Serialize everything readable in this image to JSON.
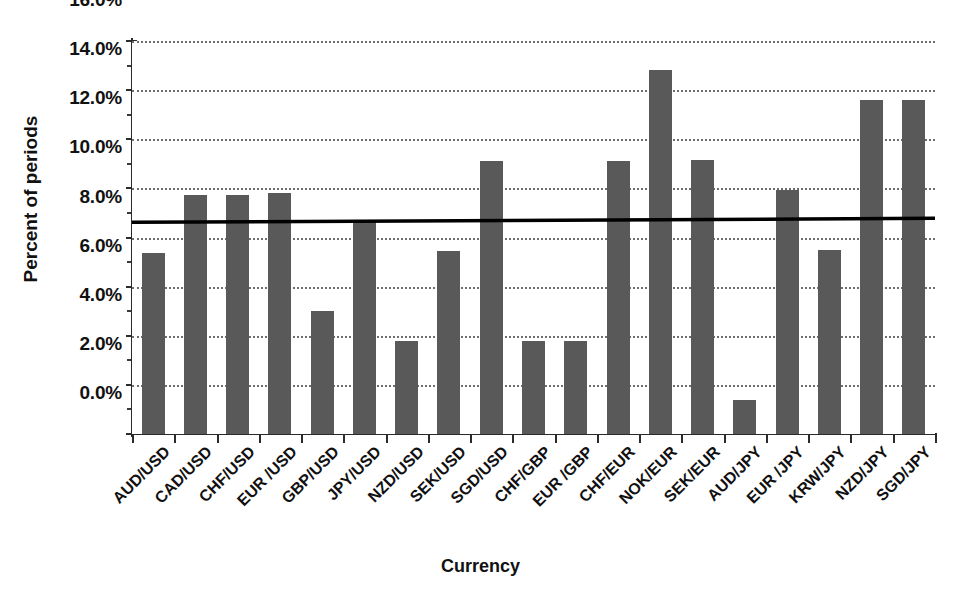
{
  "chart_data": {
    "type": "bar",
    "title": "",
    "xlabel": "Currency",
    "ylabel": "Percent of periods",
    "ylim": [
      0,
      16
    ],
    "ytick_labels": [
      "0.0%",
      "2.0%",
      "4.0%",
      "6.0%",
      "8.0%",
      "10.0%",
      "12.0%",
      "14.0%",
      "16.0%"
    ],
    "ytick_values": [
      0,
      2,
      4,
      6,
      8,
      10,
      12,
      14,
      16
    ],
    "grid": "horizontal-dotted",
    "legend": "none",
    "bar_color": "#595959",
    "axis_color": "#2b2b2b",
    "gridline_color": "#6e6e6e",
    "trendline_color": "#000000",
    "categories": [
      "AUD/USD",
      "CAD/USD",
      "CHF/USD",
      "EUR /USD",
      "GBP/USD",
      "JPY/USD",
      "NZD/USD",
      "SEK/USD",
      "SGD/USD",
      "CHF/GBP",
      "EUR /GBP",
      "CHF/EUR",
      "NOK/EUR",
      "SEK/EUR",
      "AUD/JPY",
      "EUR /JPY",
      "KRW/JPY",
      "NZD/JPY",
      "SGD/JPY"
    ],
    "values": [
      7.35,
      9.75,
      9.75,
      9.8,
      5.0,
      8.7,
      3.8,
      7.45,
      11.1,
      3.8,
      3.8,
      11.1,
      14.8,
      11.15,
      1.4,
      9.95,
      7.5,
      13.6,
      13.6
    ],
    "annotations": [
      {
        "name": "average-trend-line",
        "type": "line",
        "y_start": 8.62,
        "y_end": 8.78,
        "style": "solid-black"
      }
    ]
  }
}
